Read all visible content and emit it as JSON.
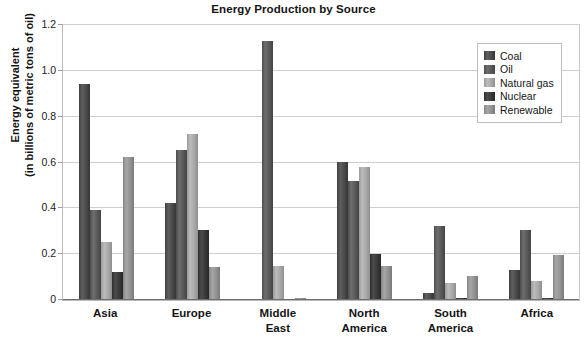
{
  "chart_data": {
    "type": "bar",
    "title": "Energy Production by Source",
    "xlabel": "",
    "ylabel": "Energy equivalent (in billions of metric tons of oil)",
    "ylabel_line1": "Energy equivalent",
    "ylabel_line2": "(in billions of metric tons of oil)",
    "categories": [
      "Asia",
      "Europe",
      "Middle East",
      "North America",
      "South America",
      "Africa"
    ],
    "category_lines": [
      [
        "Asia"
      ],
      [
        "Europe"
      ],
      [
        "Middle",
        "East"
      ],
      [
        "North",
        "America"
      ],
      [
        "South",
        "America"
      ],
      [
        "Africa"
      ]
    ],
    "series": [
      {
        "name": "Coal",
        "color": "#4b4b4b",
        "values": [
          0.94,
          0.42,
          0.0,
          0.6,
          0.025,
          0.125
        ]
      },
      {
        "name": "Oil",
        "color": "#5a5a5a",
        "values": [
          0.39,
          0.65,
          1.125,
          0.515,
          0.32,
          0.3
        ]
      },
      {
        "name": "Natural gas",
        "color": "#a9a9a9",
        "values": [
          0.25,
          0.72,
          0.145,
          0.575,
          0.07,
          0.08
        ]
      },
      {
        "name": "Nuclear",
        "color": "#3a3a3a",
        "values": [
          0.12,
          0.3,
          0.0,
          0.195,
          0.005,
          0.005
        ]
      },
      {
        "name": "Renewable",
        "color": "#939393",
        "values": [
          0.62,
          0.14,
          0.005,
          0.145,
          0.1,
          0.19
        ]
      }
    ],
    "ylim": [
      0,
      1.2
    ],
    "yticks": [
      0,
      0.2,
      0.4,
      0.6,
      0.8,
      1.0,
      1.2
    ],
    "ytick_labels": [
      "0",
      "0.2",
      "0.4",
      "0.6",
      "0.8",
      "1.0",
      "1.2"
    ],
    "grid": true,
    "legend_position": "upper right",
    "legend_entries": [
      "Coal",
      "Oil",
      "Natural gas",
      "Nuclear",
      "Renewable"
    ]
  }
}
